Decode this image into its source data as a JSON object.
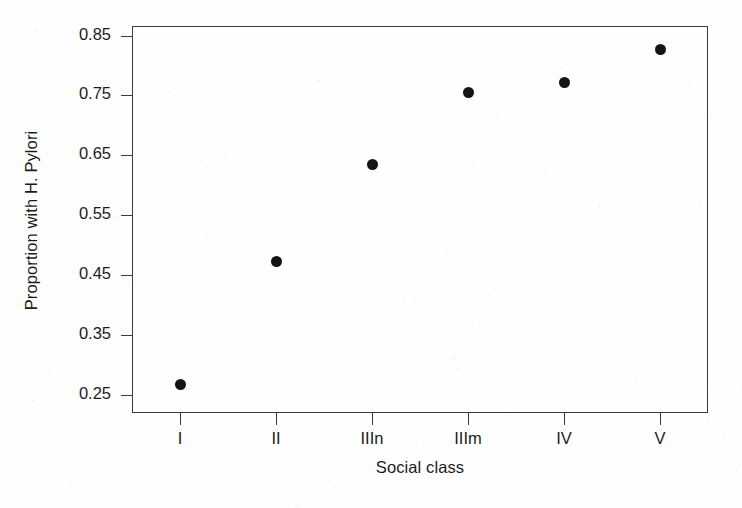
{
  "chart_data": {
    "type": "scatter",
    "title": "",
    "xlabel": "Social class",
    "ylabel": "Proportion with H. Pylori",
    "categories": [
      "I",
      "II",
      "IIIn",
      "IIIm",
      "IV",
      "V"
    ],
    "values": [
      0.267,
      0.473,
      0.635,
      0.755,
      0.771,
      0.826
    ],
    "ylim": [
      0.22,
      0.866
    ],
    "ytick_labels": [
      "0.25",
      "0.35",
      "0.45",
      "0.55",
      "0.65",
      "0.75",
      "0.85"
    ],
    "ytick_values": [
      0.25,
      0.35,
      0.45,
      0.55,
      0.65,
      0.75,
      0.85
    ],
    "xlim": [
      0.5,
      6.5
    ],
    "grid": false,
    "legend": null,
    "marker": "filled-circle",
    "marker_color": "#141414",
    "axis_color": "#3b3b3b",
    "background": "#ffffff",
    "points": [
      {
        "category": "I",
        "value": 0.267
      },
      {
        "category": "II",
        "value": 0.473
      },
      {
        "category": "IIIn",
        "value": 0.635
      },
      {
        "category": "IIIm",
        "value": 0.755
      },
      {
        "category": "IV",
        "value": 0.771
      },
      {
        "category": "V",
        "value": 0.826
      }
    ]
  }
}
